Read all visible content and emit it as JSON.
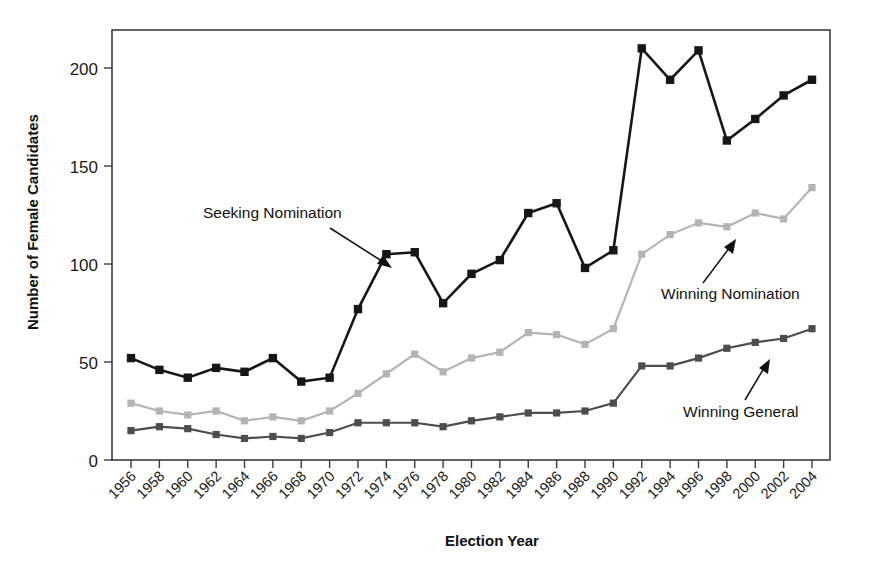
{
  "chart_data": {
    "type": "line",
    "title": "",
    "xlabel": "Election Year",
    "ylabel": "Number of Female Candidates",
    "xlim": [
      1955,
      2005
    ],
    "ylim": [
      0,
      220
    ],
    "y_ticks": [
      0,
      50,
      100,
      150,
      200
    ],
    "grid": false,
    "legend_position": "in-plot annotations with arrows",
    "categories": [
      "1956",
      "1958",
      "1960",
      "1962",
      "1964",
      "1966",
      "1968",
      "1970",
      "1972",
      "1974",
      "1976",
      "1978",
      "1980",
      "1982",
      "1984",
      "1986",
      "1988",
      "1990",
      "1992",
      "1994",
      "1996",
      "1998",
      "2000",
      "2002",
      "2004"
    ],
    "series": [
      {
        "name": "Seeking Nomination",
        "color": "#161616",
        "marker": "square",
        "values": [
          52,
          46,
          42,
          47,
          45,
          52,
          40,
          42,
          77,
          105,
          106,
          80,
          95,
          102,
          126,
          131,
          98,
          107,
          210,
          194,
          209,
          163,
          174,
          186,
          194
        ]
      },
      {
        "name": "Winning Nomination",
        "color": "#b4b4b4",
        "marker": "square",
        "values": [
          29,
          25,
          23,
          25,
          20,
          22,
          20,
          25,
          34,
          44,
          54,
          45,
          52,
          55,
          65,
          64,
          59,
          67,
          105,
          115,
          121,
          119,
          126,
          123,
          139
        ]
      },
      {
        "name": "Winning General",
        "color": "#4d4d4d",
        "marker": "square",
        "values": [
          15,
          17,
          16,
          13,
          11,
          12,
          11,
          14,
          19,
          19,
          19,
          17,
          20,
          22,
          24,
          24,
          25,
          29,
          48,
          48,
          52,
          57,
          60,
          62,
          67
        ]
      }
    ],
    "annotations": [
      {
        "text": "Seeking Nomination",
        "target_category": "1974",
        "target_series": "Seeking Nomination"
      },
      {
        "text": "Winning Nomination",
        "target_category": "2000",
        "target_series": "Winning Nomination"
      },
      {
        "text": "Winning General",
        "target_category": "2000",
        "target_series": "Winning General"
      }
    ]
  }
}
